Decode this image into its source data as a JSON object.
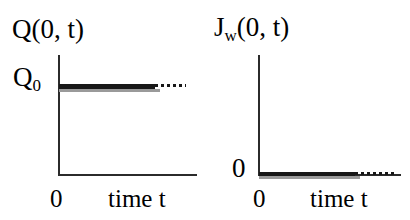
{
  "figure": {
    "background_color": "#ffffff",
    "ink_color": "#171717",
    "axis_color": "#2b2b2b"
  },
  "panels": [
    {
      "id": "left",
      "title_main": "Q(0, t)",
      "title_base": "Q",
      "title_rest": "(0, t)",
      "title_sub": "",
      "ylabel_base": "Q",
      "ylabel_sub": "0",
      "xlabel_zero": "0",
      "xlabel_time": "time t"
    },
    {
      "id": "right",
      "title_main": "J_w(0, t)",
      "title_base": "J",
      "title_rest": "(0, t)",
      "title_sub": "w",
      "ylabel_base": "0",
      "ylabel_sub": "",
      "xlabel_zero": "0",
      "xlabel_time": "time t"
    }
  ],
  "chart_data": [
    {
      "type": "line",
      "title": "Q(0, t)",
      "xlabel": "time t",
      "ylabel": "Q(0, t)",
      "xlim": [
        0,
        1
      ],
      "ylim": [
        0,
        1
      ],
      "xticks": [
        0
      ],
      "xticklabels": [
        "0"
      ],
      "yticks": [
        0.75
      ],
      "yticklabels": [
        "Q0"
      ],
      "grid": false,
      "legend": null,
      "series": [
        {
          "name": "Q(0,t) solid segment",
          "style": "solid-thick",
          "x": [
            0.0,
            0.7
          ],
          "values": [
            0.75,
            0.75
          ]
        },
        {
          "name": "Q(0,t) dotted extension",
          "style": "dotted-thin",
          "x": [
            0.7,
            0.92
          ],
          "values": [
            0.75,
            0.75
          ]
        }
      ],
      "annotations": [
        "Surface concentration held constant at Q0 for all time t"
      ]
    },
    {
      "type": "line",
      "title": "J_w(0, t)",
      "xlabel": "time t",
      "ylabel": "J_w(0, t)",
      "xlim": [
        0,
        1
      ],
      "ylim": [
        0,
        1
      ],
      "xticks": [
        0
      ],
      "xticklabels": [
        "0"
      ],
      "yticks": [
        0
      ],
      "yticklabels": [
        "0"
      ],
      "grid": false,
      "legend": null,
      "series": [
        {
          "name": "J_w(0,t) solid segment",
          "style": "solid-thick",
          "x": [
            0.0,
            0.68
          ],
          "values": [
            0.0,
            0.0
          ]
        },
        {
          "name": "J_w(0,t) dotted extension",
          "style": "dotted-thin",
          "x": [
            0.68,
            0.96
          ],
          "values": [
            0.0,
            0.0
          ]
        }
      ],
      "annotations": [
        "Surface water flux remains zero for all time t"
      ]
    }
  ]
}
